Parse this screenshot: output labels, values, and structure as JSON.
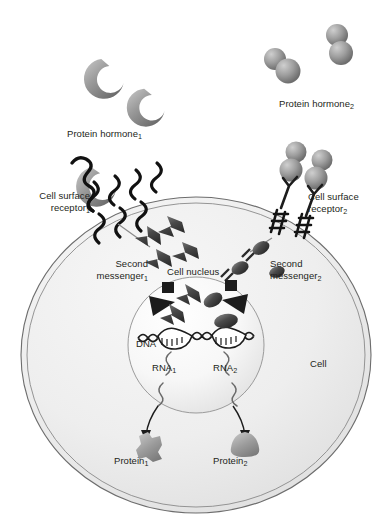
{
  "figure": {
    "type": "cell-biology-diagram",
    "background_color": "#ffffff",
    "ink_color": "#231f20",
    "cell_fill_light": "#f2f2f2",
    "cell_fill_dark": "#d9d9d9",
    "nucleus_fill": "#fbfbfb",
    "molecule_gray_light": "#b8b8b8",
    "molecule_gray_dark": "#6f6f6f",
    "membrane_stroke": "#555555"
  },
  "labels": {
    "protein_hormone_1": {
      "text": "Protein hormone",
      "sub": "1"
    },
    "protein_hormone_2": {
      "text": "Protein hormone",
      "sub": "2"
    },
    "cell_surface_receptor_1": {
      "line1": "Cell surface",
      "line2": "receptor",
      "sub": "1"
    },
    "cell_surface_receptor_2": {
      "line1": "Cell surface",
      "line2": "receptor",
      "sub": "2"
    },
    "second_messenger_1": {
      "line1": "Second",
      "line2": "messenger",
      "sub": "1"
    },
    "second_messenger_2": {
      "line1": "Second",
      "line2": "messenger",
      "sub": "2"
    },
    "cell_nucleus": {
      "text": "Cell nucleus"
    },
    "dna": {
      "text": "DNA"
    },
    "rna_1": {
      "text": "RNA",
      "sub": "1"
    },
    "rna_2": {
      "text": "RNA",
      "sub": "2"
    },
    "protein_1": {
      "text": "Protein",
      "sub": "1"
    },
    "protein_2": {
      "text": "Protein",
      "sub": "2"
    },
    "cell": {
      "text": "Cell"
    }
  },
  "elements": {
    "hormone_1_shape": "crescent",
    "hormone_1_count": 2,
    "hormone_2_shape": "sphere-dimer",
    "hormone_2_count": 2,
    "receptor_1_type": "serpentine-seven-transmembrane",
    "receptor_2_type": "y-shaped-dimer-tyrosine-kinase",
    "second_messenger_1_shape": "bowtie",
    "second_messenger_2_shape": "oval-lollipop",
    "transcription_factor_1_shape": "bowtie-on-dna",
    "transcription_factor_2_shape": "oval-on-dna",
    "protein_1_shape": "angular-jagged",
    "protein_2_shape": "rounded-triangle",
    "arrow_count": 2,
    "dna_strand_label": "DNA double helix with two transcription bubbles"
  }
}
